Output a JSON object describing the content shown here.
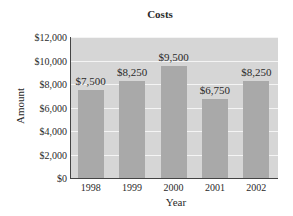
{
  "chart_data": {
    "type": "bar",
    "title": "Costs",
    "xlabel": "Year",
    "ylabel": "Amount",
    "categories": [
      "1998",
      "1999",
      "2000",
      "2001",
      "2002"
    ],
    "values": [
      7500,
      8250,
      9500,
      6750,
      8250
    ],
    "value_labels": [
      "$7,500",
      "$8,250",
      "$9,500",
      "$6,750",
      "$8,250"
    ],
    "ylim": [
      0,
      12000
    ],
    "yticks": [
      0,
      2000,
      4000,
      6000,
      8000,
      10000,
      12000
    ],
    "ytick_labels": [
      "$0",
      "$2,000",
      "$4,000",
      "$6,000",
      "$8,000",
      "$10,000",
      "$12,000"
    ],
    "grid": true,
    "legend": null,
    "colors": {
      "bar": "#a9a9a9",
      "plot_background": "#d6d6d6",
      "gridline": "#f4f4f4",
      "axis": "#444444"
    }
  }
}
